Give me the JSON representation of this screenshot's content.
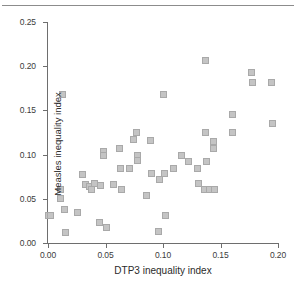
{
  "figure": {
    "top_rule": true,
    "title_fragment": ""
  },
  "chart_data": {
    "type": "scatter",
    "title": "",
    "xlabel": "DTP3 inequality index",
    "ylabel": "Measles inequality index",
    "xlim": [
      0.0,
      0.2
    ],
    "ylim": [
      0.0,
      0.25
    ],
    "xticks": [
      0.0,
      0.05,
      0.1,
      0.15,
      0.2
    ],
    "xticklabels": [
      "0.00",
      "0.05",
      "0.10",
      "0.15",
      "0.20"
    ],
    "yticks": [
      0.0,
      0.05,
      0.1,
      0.15,
      0.2,
      0.25
    ],
    "yticklabels": [
      "0.00",
      "0.05",
      "0.10",
      "0.15",
      "0.20",
      "0.25"
    ],
    "grid": false,
    "legend": null,
    "marker": {
      "shape": "square",
      "size_px": 7,
      "fill_color": "#c4c4c4",
      "edge_color": "#a9a9a9"
    },
    "points": [
      {
        "x": 0.0,
        "y": 0.031
      },
      {
        "x": 0.002,
        "y": 0.031
      },
      {
        "x": 0.011,
        "y": 0.06
      },
      {
        "x": 0.011,
        "y": 0.05
      },
      {
        "x": 0.013,
        "y": 0.168
      },
      {
        "x": 0.014,
        "y": 0.038
      },
      {
        "x": 0.015,
        "y": 0.012
      },
      {
        "x": 0.026,
        "y": 0.035
      },
      {
        "x": 0.03,
        "y": 0.078
      },
      {
        "x": 0.033,
        "y": 0.066
      },
      {
        "x": 0.036,
        "y": 0.064
      },
      {
        "x": 0.038,
        "y": 0.06
      },
      {
        "x": 0.04,
        "y": 0.067
      },
      {
        "x": 0.045,
        "y": 0.023
      },
      {
        "x": 0.046,
        "y": 0.065
      },
      {
        "x": 0.048,
        "y": 0.104
      },
      {
        "x": 0.048,
        "y": 0.099
      },
      {
        "x": 0.051,
        "y": 0.018
      },
      {
        "x": 0.057,
        "y": 0.066
      },
      {
        "x": 0.062,
        "y": 0.107
      },
      {
        "x": 0.063,
        "y": 0.084
      },
      {
        "x": 0.064,
        "y": 0.06
      },
      {
        "x": 0.071,
        "y": 0.084
      },
      {
        "x": 0.074,
        "y": 0.117
      },
      {
        "x": 0.077,
        "y": 0.125
      },
      {
        "x": 0.078,
        "y": 0.099
      },
      {
        "x": 0.078,
        "y": 0.093
      },
      {
        "x": 0.086,
        "y": 0.054
      },
      {
        "x": 0.089,
        "y": 0.116
      },
      {
        "x": 0.09,
        "y": 0.079
      },
      {
        "x": 0.096,
        "y": 0.013
      },
      {
        "x": 0.097,
        "y": 0.072
      },
      {
        "x": 0.1,
        "y": 0.168
      },
      {
        "x": 0.101,
        "y": 0.079
      },
      {
        "x": 0.102,
        "y": 0.031
      },
      {
        "x": 0.109,
        "y": 0.084
      },
      {
        "x": 0.116,
        "y": 0.099
      },
      {
        "x": 0.122,
        "y": 0.092
      },
      {
        "x": 0.13,
        "y": 0.084
      },
      {
        "x": 0.131,
        "y": 0.067
      },
      {
        "x": 0.136,
        "y": 0.06
      },
      {
        "x": 0.137,
        "y": 0.207
      },
      {
        "x": 0.137,
        "y": 0.125
      },
      {
        "x": 0.138,
        "y": 0.092
      },
      {
        "x": 0.14,
        "y": 0.06
      },
      {
        "x": 0.144,
        "y": 0.115
      },
      {
        "x": 0.144,
        "y": 0.107
      },
      {
        "x": 0.145,
        "y": 0.06
      },
      {
        "x": 0.16,
        "y": 0.145
      },
      {
        "x": 0.16,
        "y": 0.125
      },
      {
        "x": 0.177,
        "y": 0.193
      },
      {
        "x": 0.178,
        "y": 0.181
      },
      {
        "x": 0.194,
        "y": 0.181
      },
      {
        "x": 0.195,
        "y": 0.135
      }
    ]
  }
}
